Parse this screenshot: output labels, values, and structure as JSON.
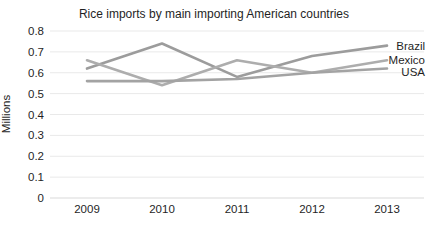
{
  "chart_data": {
    "type": "line",
    "title": "Rice imports by main importing American countries",
    "ylabel": "Millions",
    "categories": [
      "2009",
      "2010",
      "2011",
      "2012",
      "2013"
    ],
    "series": [
      {
        "name": "Brazil",
        "color": "#9c9c9c",
        "values": [
          0.62,
          0.74,
          0.58,
          0.68,
          0.73
        ]
      },
      {
        "name": "Mexico",
        "color": "#adadad",
        "values": [
          0.66,
          0.54,
          0.66,
          0.6,
          0.66
        ]
      },
      {
        "name": "USA",
        "color": "#a3a3a3",
        "values": [
          0.56,
          0.56,
          0.57,
          0.6,
          0.62
        ]
      }
    ],
    "ylim": [
      0,
      0.8
    ],
    "yticks": {
      "values": [
        0,
        0.1,
        0.2,
        0.3,
        0.4,
        0.5,
        0.6,
        0.7,
        0.8
      ],
      "labels": [
        "0",
        "0.1",
        "0.2",
        "0.3",
        "0.4",
        "0.5",
        "0.6",
        "0.7",
        "0.8"
      ]
    },
    "grid": true,
    "legend_position": "line-end-labels-right",
    "colors": {
      "gridline": "#e9e9e9",
      "baseline": "#d9d9d9",
      "text": "#1f1f1f",
      "background": "#ffffff"
    }
  }
}
